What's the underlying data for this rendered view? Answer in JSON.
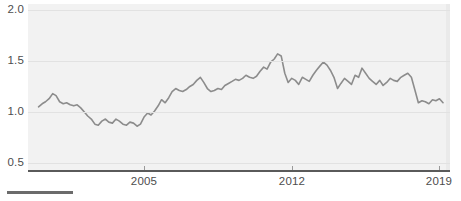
{
  "chart_data": {
    "type": "line",
    "title": "",
    "subtitle": "",
    "xlabel": "",
    "ylabel": "",
    "xlim": [
      1999.5,
      2019.5
    ],
    "ylim": [
      0.42,
      2.06
    ],
    "grid": true,
    "legend": "none",
    "y_ticks": [
      "2.0",
      "1.5",
      "1.0",
      "0.5"
    ],
    "y_tick_values": [
      2.0,
      1.5,
      1.0,
      0.5
    ],
    "x_ticks": [
      "2005",
      "2012",
      "2019"
    ],
    "x_tick_values": [
      2005,
      2012,
      2019
    ],
    "line_color": "#8c8c8c",
    "plot_background": "#f2f2f2",
    "gridline_color": "#e2e2e2",
    "axis_color": "#5a5a5a",
    "series": [
      {
        "name": "value",
        "x": [
          2000.0,
          2000.17,
          2000.33,
          2000.5,
          2000.67,
          2000.83,
          2001.0,
          2001.17,
          2001.33,
          2001.5,
          2001.67,
          2001.83,
          2002.0,
          2002.17,
          2002.33,
          2002.5,
          2002.67,
          2002.83,
          2003.0,
          2003.17,
          2003.33,
          2003.5,
          2003.67,
          2003.83,
          2004.0,
          2004.17,
          2004.33,
          2004.5,
          2004.67,
          2004.83,
          2005.0,
          2005.17,
          2005.33,
          2005.5,
          2005.67,
          2005.83,
          2006.0,
          2006.17,
          2006.33,
          2006.5,
          2006.67,
          2006.83,
          2007.0,
          2007.17,
          2007.33,
          2007.5,
          2007.67,
          2007.83,
          2008.0,
          2008.17,
          2008.33,
          2008.5,
          2008.67,
          2008.83,
          2009.0,
          2009.17,
          2009.33,
          2009.5,
          2009.67,
          2009.83,
          2010.0,
          2010.17,
          2010.33,
          2010.5,
          2010.67,
          2010.83,
          2011.0,
          2011.17,
          2011.33,
          2011.5,
          2011.67,
          2011.83,
          2012.0,
          2012.17,
          2012.33,
          2012.5,
          2012.67,
          2012.83,
          2013.0,
          2013.17,
          2013.33,
          2013.5,
          2013.67,
          2013.83,
          2014.0,
          2014.17,
          2014.33,
          2014.5,
          2014.67,
          2014.83,
          2015.0,
          2015.17,
          2015.33,
          2015.5,
          2015.67,
          2015.83,
          2016.0,
          2016.17,
          2016.33,
          2016.5,
          2016.67,
          2016.83,
          2017.0,
          2017.17,
          2017.33,
          2017.5,
          2017.67,
          2017.83,
          2018.0,
          2018.17,
          2018.33,
          2018.5,
          2018.67,
          2018.83,
          2019.0,
          2019.17
        ],
        "values": [
          1.05,
          1.08,
          1.1,
          1.13,
          1.18,
          1.16,
          1.1,
          1.08,
          1.09,
          1.07,
          1.06,
          1.07,
          1.04,
          1.0,
          0.96,
          0.93,
          0.88,
          0.87,
          0.91,
          0.93,
          0.9,
          0.89,
          0.93,
          0.91,
          0.88,
          0.87,
          0.9,
          0.89,
          0.86,
          0.88,
          0.95,
          0.99,
          0.97,
          1.01,
          1.06,
          1.12,
          1.09,
          1.14,
          1.2,
          1.23,
          1.21,
          1.2,
          1.22,
          1.25,
          1.27,
          1.31,
          1.34,
          1.29,
          1.23,
          1.2,
          1.21,
          1.23,
          1.22,
          1.26,
          1.28,
          1.3,
          1.32,
          1.31,
          1.33,
          1.36,
          1.34,
          1.33,
          1.35,
          1.4,
          1.44,
          1.42,
          1.49,
          1.52,
          1.57,
          1.55,
          1.38,
          1.29,
          1.33,
          1.31,
          1.27,
          1.34,
          1.32,
          1.3,
          1.36,
          1.41,
          1.45,
          1.49,
          1.46,
          1.41,
          1.34,
          1.23,
          1.28,
          1.33,
          1.3,
          1.27,
          1.36,
          1.34,
          1.43,
          1.38,
          1.33,
          1.3,
          1.27,
          1.31,
          1.26,
          1.29,
          1.33,
          1.31,
          1.3,
          1.34,
          1.36,
          1.38,
          1.34,
          1.22,
          1.09,
          1.11,
          1.1,
          1.08,
          1.12,
          1.11,
          1.13,
          1.09
        ]
      }
    ]
  }
}
